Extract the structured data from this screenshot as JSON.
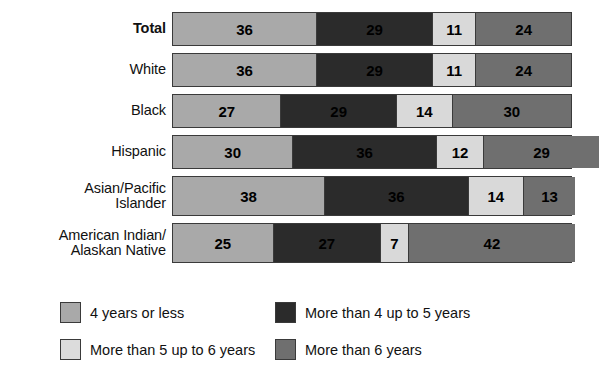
{
  "chart_data": {
    "type": "bar",
    "orientation": "horizontal",
    "stacked": true,
    "stacked_percent": true,
    "title": "",
    "subtitle": "",
    "xlabel": "",
    "ylabel": "",
    "xlim": [
      0,
      100
    ],
    "grid": false,
    "legend_position": "bottom",
    "categories": [
      "Total",
      "White",
      "Black",
      "Hispanic",
      "Asian/Pacific\nIslander",
      "American Indian/\nAlaskan Native"
    ],
    "series": [
      {
        "name": "4 years or less",
        "values": [
          36,
          36,
          27,
          30,
          38,
          25
        ]
      },
      {
        "name": "More than 4 up to 5 years",
        "values": [
          29,
          29,
          29,
          36,
          36,
          27
        ]
      },
      {
        "name": "More than 5 up to 6 years",
        "values": [
          11,
          11,
          14,
          12,
          14,
          7
        ]
      },
      {
        "name": "More than 6 years",
        "values": [
          24,
          24,
          30,
          29,
          13,
          42
        ]
      }
    ],
    "colors": [
      "#a9a9a9",
      "#2b2b2b",
      "#d9d9d9",
      "#6f6f6f"
    ],
    "annotations": []
  },
  "rows": [
    {
      "label": "Total",
      "bold": true,
      "tall": false,
      "segments": [
        {
          "value": "36",
          "pct": 36,
          "style": "s0"
        },
        {
          "value": "29",
          "pct": 29,
          "style": "s1"
        },
        {
          "value": "11",
          "pct": 11,
          "style": "s2"
        },
        {
          "value": "24",
          "pct": 24,
          "style": "s3"
        }
      ]
    },
    {
      "label": "White",
      "bold": false,
      "tall": false,
      "segments": [
        {
          "value": "36",
          "pct": 36,
          "style": "s0"
        },
        {
          "value": "29",
          "pct": 29,
          "style": "s1"
        },
        {
          "value": "11",
          "pct": 11,
          "style": "s2"
        },
        {
          "value": "24",
          "pct": 24,
          "style": "s3"
        }
      ]
    },
    {
      "label": "Black",
      "bold": false,
      "tall": false,
      "segments": [
        {
          "value": "27",
          "pct": 27,
          "style": "s0"
        },
        {
          "value": "29",
          "pct": 29,
          "style": "s1"
        },
        {
          "value": "14",
          "pct": 14,
          "style": "s2"
        },
        {
          "value": "30",
          "pct": 30,
          "style": "s3"
        }
      ]
    },
    {
      "label": "Hispanic",
      "bold": false,
      "tall": false,
      "segments": [
        {
          "value": "30",
          "pct": 30,
          "style": "s0"
        },
        {
          "value": "36",
          "pct": 36,
          "style": "s1"
        },
        {
          "value": "12",
          "pct": 12,
          "style": "s2"
        },
        {
          "value": "29",
          "pct": 29,
          "style": "s3"
        }
      ]
    },
    {
      "label": "Asian/Pacific\nIslander",
      "bold": false,
      "tall": true,
      "segments": [
        {
          "value": "38",
          "pct": 38,
          "style": "s0"
        },
        {
          "value": "36",
          "pct": 36,
          "style": "s1"
        },
        {
          "value": "14",
          "pct": 14,
          "style": "s2"
        },
        {
          "value": "13",
          "pct": 13,
          "style": "s3"
        }
      ]
    },
    {
      "label": "American Indian/\nAlaskan Native",
      "bold": false,
      "tall": true,
      "segments": [
        {
          "value": "25",
          "pct": 25,
          "style": "s0"
        },
        {
          "value": "27",
          "pct": 27,
          "style": "s1"
        },
        {
          "value": "7",
          "pct": 7,
          "style": "s2"
        },
        {
          "value": "42",
          "pct": 42,
          "style": "s3"
        }
      ]
    }
  ],
  "legend": {
    "rows": [
      [
        {
          "label": "4 years or less",
          "style": "s0",
          "name": "legend-4-years-or-less"
        },
        {
          "label": "More than 4 up to 5 years",
          "style": "s1",
          "name": "legend-more-than-4-up-to-5-years"
        }
      ],
      [
        {
          "label": "More than 5 up to 6 years",
          "style": "s2",
          "name": "legend-more-than-5-up-to-6-years"
        },
        {
          "label": "More than 6 years",
          "style": "s3",
          "name": "legend-more-than-6-years"
        }
      ]
    ]
  }
}
